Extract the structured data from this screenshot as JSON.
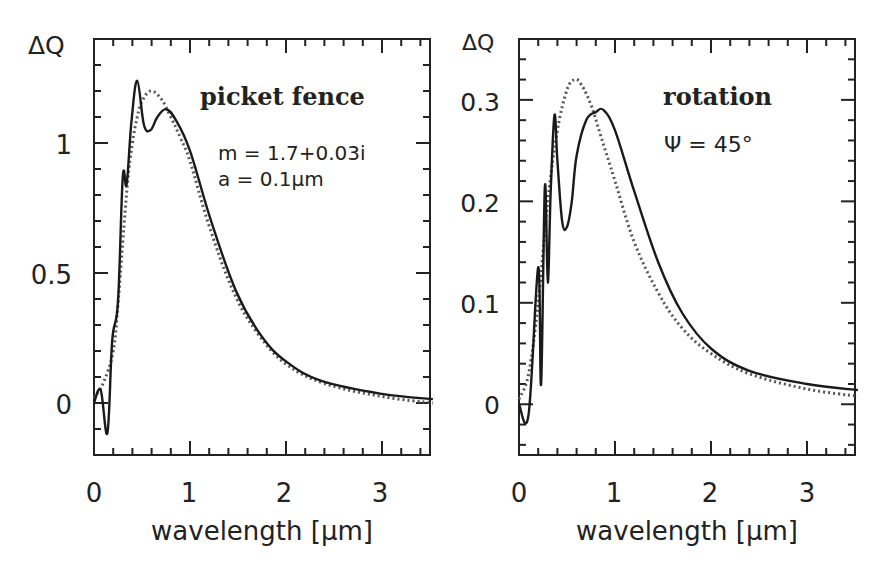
{
  "chart_data": [
    {
      "type": "line",
      "panel": "left",
      "title": "picket fence",
      "annotations": [
        "picket fence",
        "m = 1.7+0.03i",
        "a = 0.1µm"
      ],
      "xlabel": "wavelength [µm]",
      "ylabel": "ΔQ",
      "xlim": [
        0,
        3.5
      ],
      "ylim": [
        -0.2,
        1.4
      ],
      "xticks": [
        0,
        1,
        2,
        3
      ],
      "yticks": [
        0,
        0.5,
        1
      ],
      "ytick_labels": [
        "0",
        "0.5",
        "1"
      ],
      "xtick_labels": [
        "0",
        "1",
        "2",
        "3"
      ],
      "grid": false,
      "legend": null,
      "series": [
        {
          "name": "solid",
          "style": "solid",
          "x": [
            0.0,
            0.07,
            0.14,
            0.19,
            0.25,
            0.3,
            0.34,
            0.39,
            0.45,
            0.52,
            0.59,
            0.66,
            0.75,
            0.85,
            1.0,
            1.22,
            1.48,
            1.74,
            2.0,
            2.37,
            3.0,
            3.53
          ],
          "y": [
            0.0,
            0.05,
            -0.115,
            0.24,
            0.39,
            0.87,
            0.84,
            1.08,
            1.24,
            1.07,
            1.05,
            1.1,
            1.13,
            1.09,
            0.97,
            0.7,
            0.43,
            0.26,
            0.16,
            0.085,
            0.035,
            0.015
          ]
        },
        {
          "name": "dotted",
          "style": "dotted",
          "x": [
            0.0,
            0.1,
            0.2,
            0.25,
            0.3,
            0.35,
            0.4,
            0.45,
            0.5,
            0.59,
            0.7,
            0.8,
            0.9,
            1.0,
            1.2,
            1.45,
            1.7,
            2.0,
            2.4,
            3.0,
            3.53
          ],
          "y": [
            0.02,
            0.08,
            0.2,
            0.38,
            0.62,
            0.85,
            1.0,
            1.1,
            1.16,
            1.2,
            1.17,
            1.1,
            1.02,
            0.93,
            0.68,
            0.43,
            0.27,
            0.15,
            0.075,
            0.025,
            0.0
          ]
        }
      ]
    },
    {
      "type": "line",
      "panel": "right",
      "title": "rotation",
      "annotations": [
        "rotation",
        "Ψ = 45°"
      ],
      "xlabel": "wavelength [µm]",
      "ylabel": "ΔQ",
      "xlim": [
        0,
        3.5
      ],
      "ylim": [
        -0.05,
        0.36
      ],
      "xticks": [
        0,
        1,
        2,
        3
      ],
      "yticks": [
        0,
        0.1,
        0.2,
        0.3
      ],
      "ytick_labels": [
        "0",
        "0.1",
        "0.2",
        "0.3"
      ],
      "xtick_labels": [
        "0",
        "1",
        "2",
        "3"
      ],
      "grid": false,
      "legend": null,
      "series": [
        {
          "name": "solid",
          "style": "solid",
          "x": [
            0.0,
            0.1,
            0.2,
            0.23,
            0.27,
            0.3,
            0.33,
            0.37,
            0.4,
            0.45,
            0.5,
            0.55,
            0.6,
            0.7,
            0.8,
            0.88,
            1.0,
            1.2,
            1.45,
            1.7,
            2.0,
            2.4,
            3.0,
            3.53
          ],
          "y": [
            0.0,
            -0.01,
            0.135,
            0.02,
            0.215,
            0.12,
            0.21,
            0.285,
            0.24,
            0.18,
            0.175,
            0.2,
            0.245,
            0.28,
            0.288,
            0.29,
            0.27,
            0.21,
            0.14,
            0.09,
            0.055,
            0.033,
            0.02,
            0.014
          ]
        },
        {
          "name": "dotted",
          "style": "dotted",
          "x": [
            0.0,
            0.1,
            0.2,
            0.3,
            0.4,
            0.5,
            0.58,
            0.65,
            0.75,
            0.85,
            1.0,
            1.2,
            1.45,
            1.7,
            2.0,
            2.4,
            3.0,
            3.53
          ],
          "y": [
            0.005,
            0.03,
            0.1,
            0.2,
            0.27,
            0.31,
            0.32,
            0.315,
            0.295,
            0.265,
            0.22,
            0.16,
            0.11,
            0.075,
            0.05,
            0.03,
            0.015,
            0.008
          ]
        }
      ]
    }
  ],
  "panels": {
    "left": {
      "ylabel": "ΔQ",
      "title": "picket fence",
      "params": [
        "m = 1.7+0.03i",
        "a = 0.1µm"
      ],
      "xlabel": "wavelength [µm]",
      "xticks": [
        "0",
        "1",
        "2",
        "3"
      ],
      "yticks": [
        "0",
        "0.5",
        "1"
      ]
    },
    "right": {
      "ylabel": "ΔQ",
      "title": "rotation",
      "params": [
        "Ψ = 45°"
      ],
      "xlabel": "wavelength [µm]",
      "xticks": [
        "0",
        "1",
        "2",
        "3"
      ],
      "yticks": [
        "0",
        "0.1",
        "0.2",
        "0.3"
      ]
    }
  }
}
